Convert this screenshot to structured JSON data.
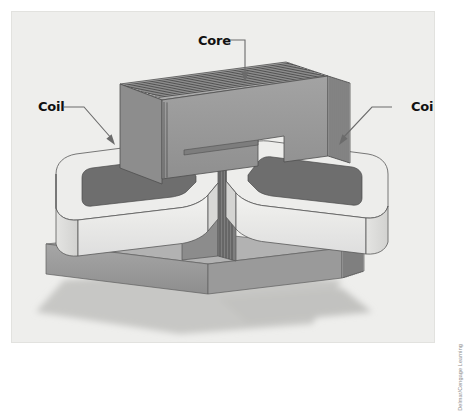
{
  "figure": {
    "kind": "technical-illustration",
    "background_color": "#ffffff",
    "panel_color": "#eeeeec",
    "panel_border_color": "#e2e2df"
  },
  "labels": {
    "core": "Core",
    "coil_left": "Coil",
    "coil_right": "Coil"
  },
  "attribution": {
    "text": "Delmar/Cengage Learning"
  },
  "colors": {
    "core_top_face": "#a9a9a9",
    "core_front_face": "#9a9a9a",
    "core_end_face": "#b4b4b4",
    "core_lamination_line": "#3d3d3d",
    "core_bottom_bar": "#9b9b9b",
    "coil_front_face": "#e9e9e7",
    "coil_top_face": "#ededeb",
    "coil_window": "#6e6e6e",
    "coil_outline": "#5a5a5a",
    "ground_shadow": "#c9c9c7",
    "leader_line": "#6b6b6b",
    "label_text": "#111111"
  },
  "parts": [
    {
      "name": "core",
      "description": "Laminated steel core, inverted-U top section plus flat bottom bar",
      "label": "Core",
      "lamination_count_top": 13,
      "lamination_count_end": 11
    },
    {
      "name": "coil-left",
      "description": "Left winding, light rounded rectangular block with dark center window",
      "label": "Coil"
    },
    {
      "name": "coil-right",
      "description": "Right winding, light rounded rectangular block with dark center window",
      "label": "Coil"
    }
  ],
  "leaders": [
    {
      "name": "core-leader",
      "from": "Core label",
      "to": "core top face",
      "style": "elbow-down-arrow"
    },
    {
      "name": "coil-left-leader",
      "from": "Coil label",
      "to": "left coil top",
      "style": "elbow-diagonal-arrow"
    },
    {
      "name": "coil-right-leader",
      "from": "Coil label",
      "to": "right coil top",
      "style": "elbow-diagonal-arrow"
    }
  ]
}
